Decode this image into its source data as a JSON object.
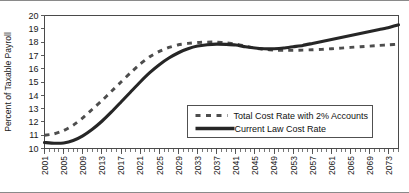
{
  "chart_data": {
    "type": "line",
    "title": "",
    "xlabel": "",
    "ylabel": "Percent of Taxable Payroll",
    "xlim": [
      2001,
      2075
    ],
    "ylim": [
      10,
      20
    ],
    "ytick_step": 1,
    "xtick_step": 4,
    "grid": false,
    "legend_position": "center-right-inside",
    "yticks": [
      "20",
      "19",
      "18",
      "17",
      "16",
      "15",
      "14",
      "13",
      "12",
      "11",
      "10"
    ],
    "xticks": [
      "2001",
      "2005",
      "2009",
      "2013",
      "2017",
      "2021",
      "2025",
      "2029",
      "2033",
      "2037",
      "2041",
      "2045",
      "2049",
      "2053",
      "2057",
      "2061",
      "2065",
      "2069",
      "2073"
    ],
    "x": [
      2001,
      2003,
      2005,
      2007,
      2009,
      2011,
      2013,
      2015,
      2017,
      2019,
      2021,
      2023,
      2025,
      2027,
      2029,
      2031,
      2033,
      2035,
      2037,
      2039,
      2041,
      2043,
      2045,
      2047,
      2049,
      2051,
      2053,
      2055,
      2057,
      2059,
      2061,
      2063,
      2065,
      2067,
      2069,
      2071,
      2073,
      2075
    ],
    "series": [
      {
        "name": "Total Cost Rate with 2% Accounts",
        "style": "dashed",
        "color": "#4d4d4d",
        "values": [
          11.0,
          11.1,
          11.35,
          11.75,
          12.3,
          12.95,
          13.6,
          14.3,
          15.0,
          15.7,
          16.35,
          16.9,
          17.3,
          17.6,
          17.8,
          17.9,
          17.97,
          18.0,
          18.0,
          17.95,
          17.85,
          17.7,
          17.55,
          17.45,
          17.4,
          17.38,
          17.38,
          17.4,
          17.42,
          17.45,
          17.5,
          17.55,
          17.6,
          17.65,
          17.7,
          17.75,
          17.8,
          17.85
        ]
      },
      {
        "name": "Current Law Cost Rate",
        "style": "solid",
        "color": "#262626",
        "values": [
          10.45,
          10.4,
          10.42,
          10.6,
          10.95,
          11.45,
          12.05,
          12.75,
          13.5,
          14.25,
          15.0,
          15.7,
          16.3,
          16.8,
          17.2,
          17.5,
          17.7,
          17.8,
          17.85,
          17.83,
          17.78,
          17.65,
          17.55,
          17.5,
          17.5,
          17.55,
          17.65,
          17.75,
          17.9,
          18.05,
          18.2,
          18.35,
          18.5,
          18.65,
          18.8,
          18.95,
          19.1,
          19.3
        ]
      }
    ]
  },
  "legend": {
    "items": [
      {
        "label": "Total Cost Rate with 2% Accounts",
        "style": "dashed"
      },
      {
        "label": "Current Law Cost Rate",
        "style": "solid"
      }
    ]
  }
}
